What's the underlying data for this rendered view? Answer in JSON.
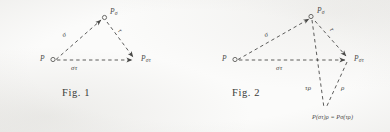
{
  "figure": {
    "medium": "scanned book page",
    "background_color": "#fbfbfa",
    "ink_color": "#4a4a48",
    "line_style": "dashed",
    "panels": [
      {
        "id": "fig1",
        "caption": "Fig. 1",
        "vertices": [
          {
            "name": "P",
            "base": "P",
            "sub": "",
            "marker": "open-circle",
            "x": 50,
            "y": 59
          },
          {
            "name": "Psigma",
            "base": "P",
            "sub": "σ",
            "marker": "open-circle",
            "x": 104,
            "y": 17
          },
          {
            "name": "Psigmatau",
            "base": "P",
            "sub": "στ",
            "marker": "arrowhead",
            "x": 136,
            "y": 60
          }
        ],
        "edges": [
          {
            "name": "sigma-edge",
            "label": "σ",
            "from": "P",
            "to": "Psigma",
            "arrow": true
          },
          {
            "name": "tau-edge",
            "label": "τ",
            "from": "Psigma",
            "to": "Psigmatau",
            "arrow": true
          },
          {
            "name": "sigma-tau-edge",
            "label": "στ",
            "from": "P",
            "to": "Psigmatau",
            "arrow": true
          }
        ]
      },
      {
        "id": "fig2",
        "caption": "Fig. 2",
        "vertices": [
          {
            "name": "P",
            "base": "P",
            "sub": "",
            "marker": "open-circle",
            "x": 232,
            "y": 59
          },
          {
            "name": "Psigma",
            "base": "P",
            "sub": "σ",
            "marker": "open-circle",
            "x": 312,
            "y": 16
          },
          {
            "name": "Psigmatau",
            "base": "P",
            "sub": "στ",
            "marker": "arrowhead",
            "x": 349,
            "y": 59
          },
          {
            "name": "Presult",
            "base": "",
            "sub": "",
            "marker": "none",
            "x": 326,
            "y": 110
          }
        ],
        "edges": [
          {
            "name": "sigma-edge",
            "label": "σ",
            "from": "P",
            "to": "Psigma",
            "arrow": true
          },
          {
            "name": "tau-edge",
            "label": "τ",
            "from": "Psigma",
            "to": "Psigmatau",
            "arrow": true
          },
          {
            "name": "sigma-tau-edge",
            "label": "στ",
            "from": "P",
            "to": "Psigmatau",
            "arrow": true
          },
          {
            "name": "tau-rho-edge",
            "label": "τρ",
            "from": "Psigma",
            "to": "Presult",
            "arrow": false
          },
          {
            "name": "rho-edge",
            "label": "ρ",
            "from": "Psigmatau",
            "to": "Presult",
            "arrow": false
          }
        ],
        "result_label": "P(στ)ρ = Pσ(τρ)"
      }
    ]
  },
  "fig1": {
    "caption": "Fig. 1",
    "vertex_P": "P",
    "vertex_Psigma_base": "P",
    "vertex_Psigma_sub": "σ",
    "vertex_Psigmatau_base": "P",
    "vertex_Psigmatau_sub": "στ",
    "edge_sigma": "σ",
    "edge_tau": "τ",
    "edge_sigmatau": "στ"
  },
  "fig2": {
    "caption": "Fig. 2",
    "vertex_P": "P",
    "vertex_Psigma_base": "P",
    "vertex_Psigma_sub": "σ",
    "vertex_Psigmatau_base": "P",
    "vertex_Psigmatau_sub": "στ",
    "edge_sigma": "σ",
    "edge_tau": "τ",
    "edge_sigmatau": "στ",
    "edge_taurho": "τρ",
    "edge_rho": "ρ",
    "result_prefix": "P",
    "result_body": "(στ)ρ = Pσ(τρ)",
    "result_full": "P(στ)ρ = Pσ(τρ)"
  }
}
